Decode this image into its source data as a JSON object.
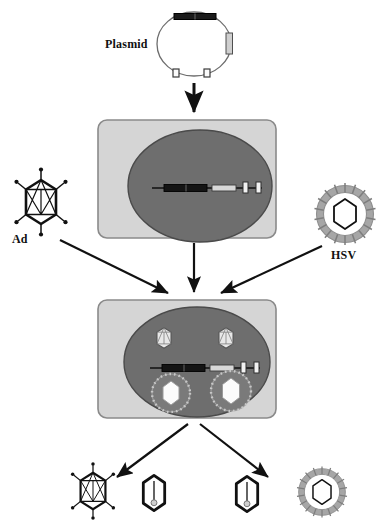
{
  "figure": {
    "type": "biology-schematic"
  },
  "labels": {
    "plasmid": "Plasmid",
    "ad": "Ad",
    "hsv": "HSV"
  },
  "colors": {
    "cell_box_fill": "#d5d5d5",
    "cell_box_stroke": "#8a8a8a",
    "nucleus_fill": "#6e6e6e",
    "nucleus_stroke": "#4a4a4a",
    "dna_line": "#111111",
    "dna_dark_segment": "#141414",
    "dna_light_segment": "#d8d8d8",
    "marker_fill": "#f2f2f2",
    "capsid_stroke": "#111111",
    "envelope_gray": "#9a9a9a",
    "arrow": "#111111",
    "background": "#ffffff"
  },
  "elements": {
    "plasmid": {
      "name": "Plasmid",
      "shape": "circular-dna",
      "features": [
        {
          "id": "dark-bar-top",
          "style": "dark-filled-bar",
          "position": "top"
        },
        {
          "id": "gray-bar-right",
          "style": "light-gray-bar",
          "position": "right"
        },
        {
          "id": "marker-left",
          "style": "white-square",
          "position": "bottom-left"
        },
        {
          "id": "marker-right",
          "style": "white-square",
          "position": "bottom-right"
        }
      ]
    },
    "cell_top": {
      "name": "Transfected cell",
      "nucleus_contents": [
        "linear-dna-construct"
      ]
    },
    "cell_bottom": {
      "name": "Co-infected producer cell",
      "nucleus_contents": [
        "linear-dna-construct",
        "ad-capsid-1",
        "ad-capsid-2",
        "hsv-particle-1",
        "hsv-particle-2"
      ]
    },
    "dna_construct": {
      "segments": [
        {
          "id": "dark-block",
          "style": "dark-filled-box"
        },
        {
          "id": "light-block",
          "style": "light-gray-box"
        },
        {
          "id": "marker-1",
          "style": "white-square"
        },
        {
          "id": "marker-2",
          "style": "white-square"
        }
      ]
    },
    "ad_virion": {
      "name": "Adenovirus",
      "capsid": "icosahedral-hexagon",
      "fibers": 6
    },
    "hsv_virion": {
      "name": "Herpes simplex virus",
      "capsid": "hexagonal",
      "envelope": "spiked-ring"
    },
    "outputs": [
      {
        "id": "output-ad",
        "type": "ad-virion"
      },
      {
        "id": "output-capsid-left",
        "type": "naked-capsid"
      },
      {
        "id": "output-capsid-right",
        "type": "naked-capsid"
      },
      {
        "id": "output-hsv",
        "type": "hsv-virion"
      }
    ]
  },
  "arrows": [
    {
      "id": "plasmid-to-cell",
      "from": "plasmid",
      "to": "cell_top",
      "direction": "down"
    },
    {
      "id": "ad-to-cell",
      "from": "ad",
      "to": "cell_bottom",
      "direction": "down-right"
    },
    {
      "id": "cell-top-to-cell-bottom",
      "from": "cell_top",
      "to": "cell_bottom",
      "direction": "down"
    },
    {
      "id": "hsv-to-cell",
      "from": "hsv",
      "to": "cell_bottom",
      "direction": "down-left"
    },
    {
      "id": "cell-to-output-left",
      "from": "cell_bottom",
      "to": "output-left",
      "direction": "down-left"
    },
    {
      "id": "cell-to-output-right",
      "from": "cell_bottom",
      "to": "output-right",
      "direction": "down-right"
    }
  ]
}
